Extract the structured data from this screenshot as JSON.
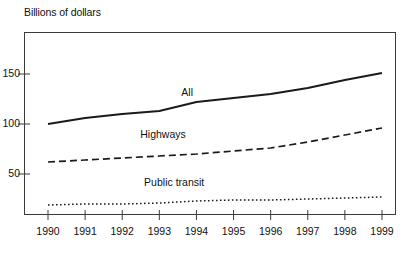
{
  "figure": {
    "axis_title": "Billions of dollars",
    "series_labels": [
      {
        "name": "all",
        "text": "All"
      },
      {
        "name": "highways",
        "text": "Highways"
      },
      {
        "name": "public-transit",
        "text": "Public transit"
      }
    ],
    "colors": {
      "line": "#1a1a1a",
      "frame": "#3a3a3a",
      "text": "#111111",
      "background": "#ffffff"
    }
  },
  "chart_data": {
    "type": "line",
    "title": "",
    "ylabel": "Billions of dollars",
    "xlabel": "",
    "x": [
      1990,
      1991,
      1992,
      1993,
      1994,
      1995,
      1996,
      1997,
      1998,
      1999
    ],
    "categories": [
      "1990",
      "1991",
      "1992",
      "1993",
      "1994",
      "1995",
      "1996",
      "1997",
      "1998",
      "1999"
    ],
    "xtick_labels": [
      "1990",
      "1991",
      "1992",
      "1993",
      "1994",
      "1995",
      "1996",
      "1997",
      "1998",
      "1999"
    ],
    "ytick_labels": [
      "50",
      "100",
      "150"
    ],
    "yticks": [
      50,
      100,
      150
    ],
    "ylim": [
      0,
      183
    ],
    "xlim": [
      1989.4,
      1999.6
    ],
    "grid": false,
    "legend": "inline-labels",
    "series": [
      {
        "name": "All",
        "style": "solid",
        "values": [
          100,
          106,
          110,
          113,
          122,
          126,
          130,
          136,
          144,
          151
        ]
      },
      {
        "name": "Highways",
        "style": "dashed",
        "values": [
          62,
          64,
          66,
          68,
          70,
          73,
          76,
          82,
          89,
          96
        ]
      },
      {
        "name": "Public transit",
        "style": "dotted",
        "values": [
          19,
          20,
          20,
          21,
          23,
          24,
          24,
          25,
          26,
          27
        ]
      }
    ],
    "annotations": [
      {
        "text": "All",
        "x": 1993.75,
        "y": 131
      },
      {
        "text": "Highways",
        "x": 1993.1,
        "y": 89
      },
      {
        "text": "Public transit",
        "x": 1993.4,
        "y": 41
      }
    ]
  }
}
